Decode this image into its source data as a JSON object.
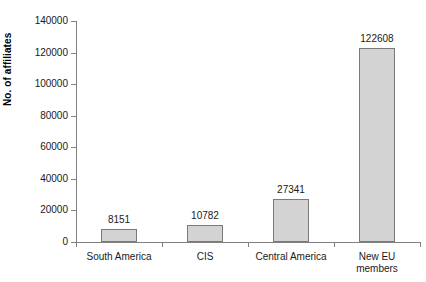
{
  "chart_data": {
    "type": "bar",
    "title": "",
    "subtitle": "",
    "xlabel": "",
    "ylabel": "No. of affiliates",
    "categories": [
      "South America",
      "CIS",
      "Central America",
      "New EU members"
    ],
    "category_lines": [
      [
        "South America"
      ],
      [
        "CIS"
      ],
      [
        "Central America"
      ],
      [
        "New EU",
        "members"
      ]
    ],
    "values": [
      8151,
      10782,
      27341,
      122608
    ],
    "value_labels": [
      "8151",
      "10782",
      "27341",
      "122608"
    ],
    "ylim": [
      0,
      140000
    ],
    "ytick_values": [
      0,
      20000,
      40000,
      60000,
      80000,
      100000,
      120000,
      140000
    ],
    "ytick_labels": [
      "0",
      "20000",
      "40000",
      "60000",
      "80000",
      "100000",
      "120000",
      "140000"
    ],
    "grid": false,
    "legend": false,
    "legend_position": "none",
    "data_labels": true,
    "colors": {
      "bar_fill": "#d3d3d3",
      "bar_border": "#7a7a7a",
      "axis": "#808080",
      "text": "#1a1a1a",
      "background": "#ffffff"
    }
  }
}
